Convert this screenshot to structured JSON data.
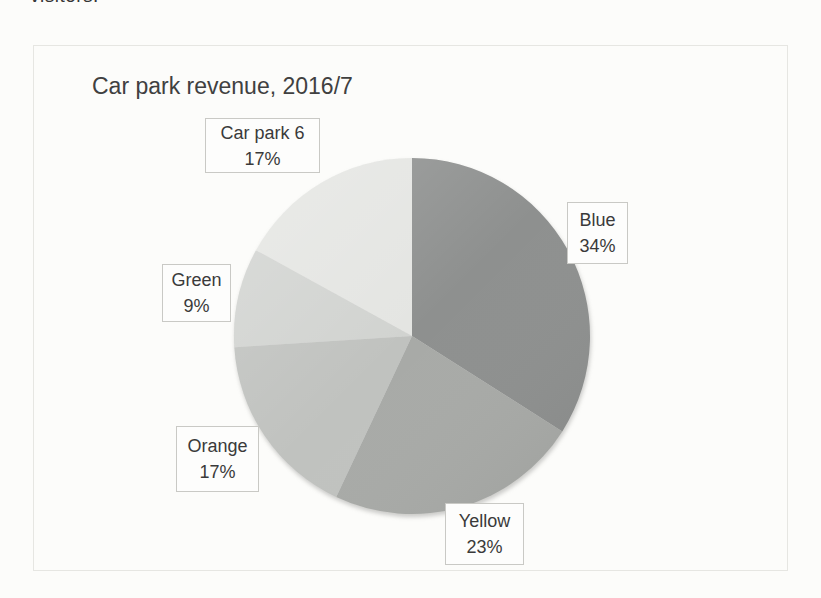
{
  "page": {
    "top_cropped_text": "visitors."
  },
  "chart_data": {
    "type": "pie",
    "title": "Car park revenue, 2016/7",
    "categories": [
      "Blue",
      "Yellow",
      "Orange",
      "Green",
      "Car park 6"
    ],
    "values": [
      34,
      23,
      17,
      9,
      17
    ],
    "unit": "%",
    "start_angle": 0,
    "direction": "clockwise",
    "legend": "none",
    "label_style": "callout-boxes",
    "callouts": [
      {
        "name": "Blue",
        "pct": "34%"
      },
      {
        "name": "Yellow",
        "pct": "23%"
      },
      {
        "name": "Orange",
        "pct": "17%"
      },
      {
        "name": "Green",
        "pct": "9%"
      },
      {
        "name": "Car park 6",
        "pct": "17%"
      }
    ],
    "print_gray_colors": [
      "#8e908f",
      "#a8aaa7",
      "#c0c2bf",
      "#d1d3d0",
      "#e4e5e2"
    ]
  }
}
